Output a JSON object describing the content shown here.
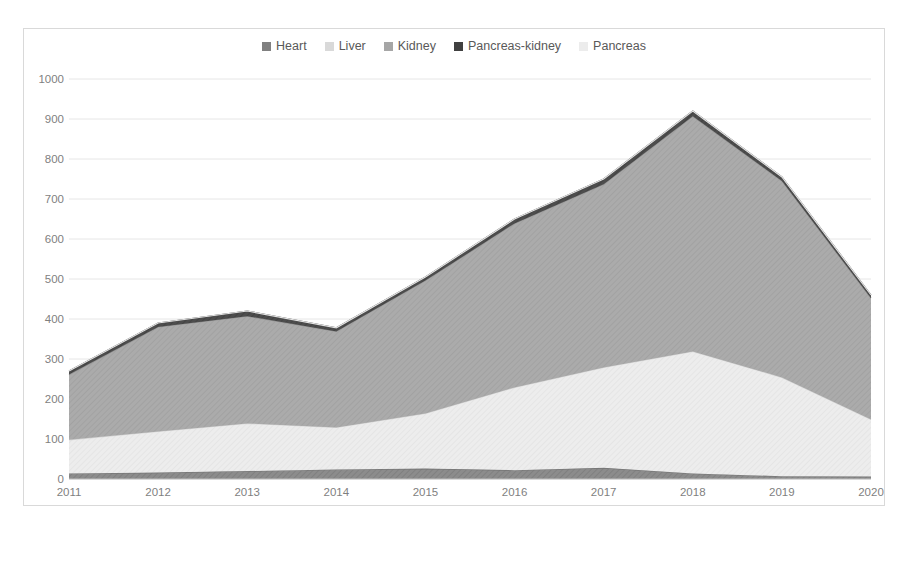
{
  "chart_data": {
    "type": "area",
    "stacked": true,
    "title": "",
    "xlabel": "",
    "ylabel": "",
    "categories": [
      "2011",
      "2012",
      "2013",
      "2014",
      "2015",
      "2016",
      "2017",
      "2018",
      "2019",
      "2020"
    ],
    "ylim": [
      0,
      1000
    ],
    "ytick_step": 100,
    "yticks": [
      "0",
      "100",
      "200",
      "300",
      "400",
      "500",
      "600",
      "700",
      "800",
      "900",
      "1000"
    ],
    "grid": "horizontal",
    "legend_position": "top-center",
    "series": [
      {
        "name": "Heart",
        "color": "#808080",
        "values": [
          14,
          16,
          20,
          24,
          26,
          22,
          28,
          14,
          7,
          6
        ]
      },
      {
        "name": "Liver",
        "color": "#e8e8e8",
        "values": [
          84,
          103,
          119,
          105,
          138,
          207,
          251,
          305,
          247,
          143
        ]
      },
      {
        "name": "Kidney",
        "color": "#a6a6a6",
        "values": [
          163,
          261,
          268,
          240,
          332,
          410,
          458,
          588,
          491,
          303
        ]
      },
      {
        "name": "Pancreas-kidney",
        "color": "#404040",
        "values": [
          9,
          10,
          13,
          9,
          9,
          11,
          13,
          13,
          10,
          8
        ]
      },
      {
        "name": "Pancreas",
        "color": "#f2f2f2",
        "values": [
          0,
          0,
          0,
          0,
          0,
          0,
          0,
          0,
          0,
          0
        ]
      }
    ],
    "stack_totals": [
      270,
      390,
      420,
      378,
      505,
      650,
      750,
      920,
      755,
      460
    ]
  },
  "legend": {
    "items": [
      {
        "label": "Heart",
        "color": "#808080"
      },
      {
        "label": "Liver",
        "color": "#d9d9d9"
      },
      {
        "label": "Kidney",
        "color": "#a6a6a6"
      },
      {
        "label": "Pancreas-kidney",
        "color": "#404040"
      },
      {
        "label": "Pancreas",
        "color": "#ececec"
      }
    ]
  }
}
